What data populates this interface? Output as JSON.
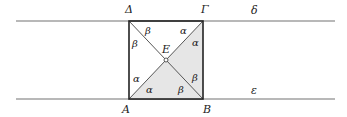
{
  "figure": {
    "lines": {
      "top": {
        "label": "δ",
        "y": 21,
        "x1": 16,
        "x2": 335
      },
      "bottom": {
        "label": "ε",
        "y": 99,
        "x1": 16,
        "x2": 335
      }
    },
    "square": {
      "x1": 129,
      "y1": 21,
      "x2": 203,
      "y2": 99,
      "fill_shaded": "#e6e6e6",
      "stroke": "#222222"
    },
    "vertices": {
      "top_left": "Δ",
      "top_right": "Γ",
      "bottom_left": "A",
      "bottom_right": "B",
      "center": "E"
    },
    "angles": {
      "top_left_a": "β",
      "top_left_b": "β",
      "top_right_a": "α",
      "top_right_b": "α",
      "bottom_left_a": "α",
      "bottom_left_b": "α",
      "bottom_right_a": "β",
      "bottom_right_b": "β"
    },
    "colors": {
      "line": "#999999",
      "square_edge": "#222222",
      "shade": "#e6e6e6"
    }
  }
}
